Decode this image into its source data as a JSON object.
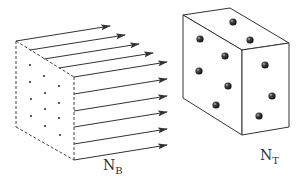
{
  "diagram": {
    "beam": {
      "label_main": "N",
      "label_sub": "B",
      "style": "dashed box with parallel arrows and small dot grid",
      "arrow_count": 10,
      "dot_grid": "3 columns x 4 rows"
    },
    "target": {
      "label_main": "N",
      "label_sub": "T",
      "style": "solid rectangular box with shaded spheres",
      "sphere_count": 10
    },
    "colors": {
      "line": "#333333",
      "background": "#ffffff"
    }
  }
}
